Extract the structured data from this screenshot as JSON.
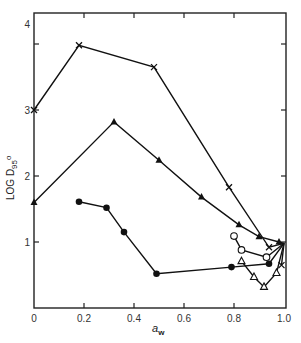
{
  "chart_data": {
    "type": "line",
    "title": "",
    "xlabel": "a_w",
    "xlabel_main": "a",
    "xlabel_sub": "w",
    "ylabel": "LOG D95°",
    "ylabel_parts": {
      "main": "LOG  D",
      "sub": "95",
      "sup": "o"
    },
    "xlim": [
      0,
      1.0
    ],
    "ylim": [
      0,
      4.5
    ],
    "x_ticks": [
      0,
      0.2,
      0.4,
      0.6,
      0.8,
      1.0
    ],
    "x_tick_labels": [
      "0",
      "0.2",
      "0.4",
      "0.6",
      "0.8",
      "1.0"
    ],
    "y_ticks": [
      1,
      2,
      3,
      4
    ],
    "y_tick_labels": [
      "1",
      "2",
      "3",
      "4"
    ],
    "grid": false,
    "legend": null,
    "series": [
      {
        "name": "cross",
        "marker": "x",
        "x": [
          0,
          0.18,
          0.48,
          0.78,
          0.94,
          1.0,
          0.99
        ],
        "y": [
          3.0,
          3.98,
          3.65,
          1.83,
          0.92,
          0.98,
          0.65
        ]
      },
      {
        "name": "filled-triangle",
        "marker": "triangle-filled",
        "x": [
          0,
          0.32,
          0.5,
          0.67,
          0.82,
          0.9,
          0.98,
          1.0
        ],
        "y": [
          1.6,
          2.82,
          2.24,
          1.68,
          1.26,
          1.08,
          1.0,
          0.98
        ]
      },
      {
        "name": "filled-circle",
        "marker": "circle-filled",
        "x": [
          0.18,
          0.29,
          0.36,
          0.49,
          0.79,
          0.94,
          1.0
        ],
        "y": [
          1.61,
          1.52,
          1.15,
          0.52,
          0.62,
          0.67,
          0.98
        ]
      },
      {
        "name": "open-circle",
        "marker": "circle-open",
        "x": [
          0.8,
          0.83,
          0.93,
          1.0
        ],
        "y": [
          1.09,
          0.88,
          0.77,
          0.98
        ]
      },
      {
        "name": "open-triangle",
        "marker": "triangle-open",
        "x": [
          0.83,
          0.88,
          0.92,
          0.97,
          1.0
        ],
        "y": [
          0.71,
          0.47,
          0.32,
          0.53,
          0.98
        ]
      }
    ]
  }
}
